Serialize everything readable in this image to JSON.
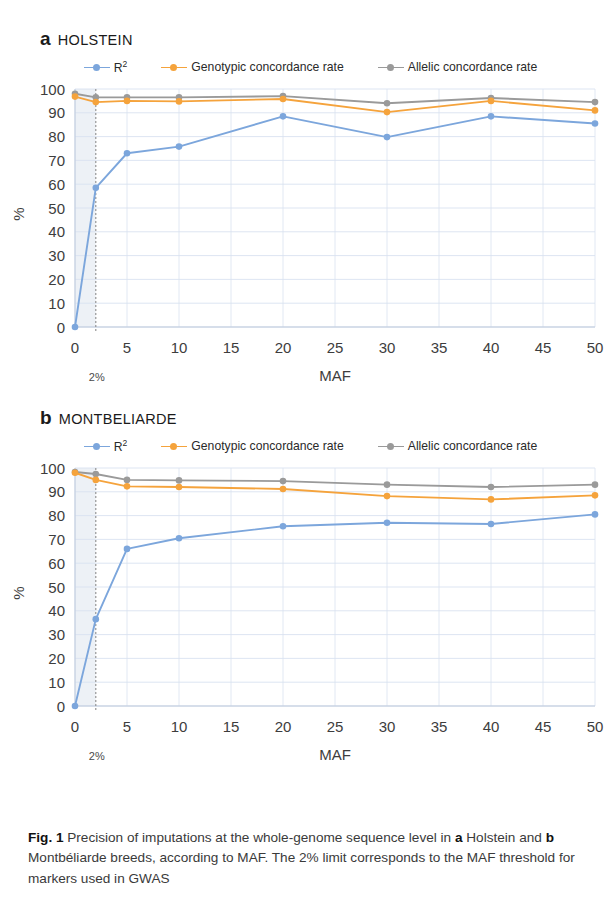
{
  "figure": {
    "caption_prefix": "Fig. 1",
    "caption_part1": " Precision of imputations at the whole-genome sequence level in ",
    "caption_bold_a": "a",
    "caption_part2": " Holstein and ",
    "caption_bold_b": "b",
    "caption_part3": " Montbéliarde breeds, according to MAF. The 2% limit corresponds to the MAF threshold for markers used in GWAS"
  },
  "colors": {
    "r2": "#7CA6DC",
    "genotypic": "#F5A33C",
    "allelic": "#9A9A9A",
    "grid": "#D9E2F0",
    "axis": "#BFCBDD",
    "threshold_line": "#8C8C8C",
    "threshold_band": "#E7ECF3",
    "text": "#3d3d3d"
  },
  "legend": {
    "items": [
      {
        "label": "R",
        "sup": "2",
        "series": "r2",
        "color": "#7CA6DC"
      },
      {
        "label": "Genotypic concordance rate",
        "sup": "",
        "series": "genotypic",
        "color": "#F5A33C"
      },
      {
        "label": "Allelic concordance rate",
        "sup": "",
        "series": "allelic",
        "color": "#9A9A9A"
      }
    ]
  },
  "panels": [
    {
      "letter": "a",
      "name": "HOLSTEIN",
      "chart_data": {
        "type": "line",
        "title": "HOLSTEIN",
        "xlabel": "MAF",
        "ylabel": "%",
        "xlim": [
          0,
          50
        ],
        "ylim": [
          0,
          100
        ],
        "xticks": [
          0,
          5,
          10,
          15,
          20,
          25,
          30,
          35,
          40,
          45,
          50
        ],
        "yticks": [
          0,
          10,
          20,
          30,
          40,
          50,
          60,
          70,
          80,
          90,
          100
        ],
        "grid": true,
        "legend_position": "top",
        "annotations": [
          {
            "text": "2%",
            "x": 2,
            "type": "vertical-threshold-line"
          }
        ],
        "x": [
          0,
          2,
          5,
          10,
          20,
          30,
          40,
          50
        ],
        "series": [
          {
            "name": "R2",
            "key": "r2",
            "color": "#7CA6DC",
            "values": [
              0,
              58.5,
              73.0,
              75.8,
              88.5,
              79.8,
              88.5,
              85.5
            ]
          },
          {
            "name": "Genotypic concordance rate",
            "key": "genotypic",
            "color": "#F5A33C",
            "values": [
              96.8,
              94.5,
              95.0,
              94.8,
              95.8,
              90.3,
              95.0,
              91.0
            ]
          },
          {
            "name": "Allelic concordance rate",
            "key": "allelic",
            "color": "#9A9A9A",
            "values": [
              98.0,
              96.5,
              96.5,
              96.5,
              97.0,
              94.0,
              96.2,
              94.5
            ]
          }
        ]
      }
    },
    {
      "letter": "b",
      "name": "MONTBELIARDE",
      "chart_data": {
        "type": "line",
        "title": "MONTBELIARDE",
        "xlabel": "MAF",
        "ylabel": "%",
        "xlim": [
          0,
          50
        ],
        "ylim": [
          0,
          100
        ],
        "xticks": [
          0,
          5,
          10,
          15,
          20,
          25,
          30,
          35,
          40,
          45,
          50
        ],
        "yticks": [
          0,
          10,
          20,
          30,
          40,
          50,
          60,
          70,
          80,
          90,
          100
        ],
        "grid": true,
        "legend_position": "top",
        "annotations": [
          {
            "text": "2%",
            "x": 2,
            "type": "vertical-threshold-line"
          }
        ],
        "x": [
          0,
          2,
          5,
          10,
          20,
          30,
          40,
          50
        ],
        "series": [
          {
            "name": "R2",
            "key": "r2",
            "color": "#7CA6DC",
            "values": [
              0,
              36.5,
              66.0,
              70.5,
              75.5,
              77.0,
              76.5,
              80.5
            ]
          },
          {
            "name": "Genotypic concordance rate",
            "key": "genotypic",
            "color": "#F5A33C",
            "values": [
              98.0,
              95.0,
              92.3,
              92.0,
              91.2,
              88.2,
              86.8,
              88.5
            ]
          },
          {
            "name": "Allelic concordance rate",
            "key": "allelic",
            "color": "#9A9A9A",
            "values": [
              98.3,
              97.5,
              95.0,
              94.8,
              94.5,
              93.0,
              92.0,
              93.0
            ]
          }
        ]
      }
    }
  ]
}
